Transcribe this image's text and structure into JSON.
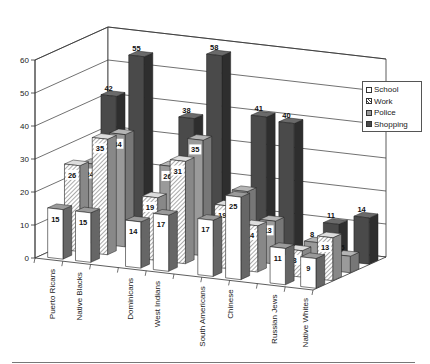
{
  "chart_data": {
    "type": "bar",
    "variant": "3d-clustered",
    "title": "",
    "xlabel": "",
    "ylabel": "",
    "ylim": [
      0,
      60
    ],
    "yticks": [
      0,
      10,
      20,
      30,
      40,
      50,
      60
    ],
    "grid": true,
    "legend_position": "right",
    "categories": [
      "Puerto Ricans",
      "Native Blacks",
      "Dominicans",
      "West Indians",
      "South Americans",
      "Chinese",
      "Russian Jews",
      "Native Whites"
    ],
    "series": [
      {
        "name": "School",
        "values": [
          15,
          15,
          14,
          17,
          17,
          25,
          11,
          9
        ],
        "color": "#ffffff",
        "pattern": "none"
      },
      {
        "name": "Work",
        "values": [
          26,
          35,
          19,
          31,
          19,
          14,
          8,
          13
        ],
        "color": "#ffffff",
        "pattern": "diagonal-hatch"
      },
      {
        "name": "Police",
        "values": [
          24,
          34,
          26,
          35,
          21,
          13,
          8,
          5
        ],
        "color": "#9a9a9a",
        "pattern": "none"
      },
      {
        "name": "Shopping",
        "values": [
          42,
          55,
          38,
          58,
          41,
          40,
          11,
          14
        ],
        "color": "#4a4a4a",
        "pattern": "none"
      }
    ]
  }
}
